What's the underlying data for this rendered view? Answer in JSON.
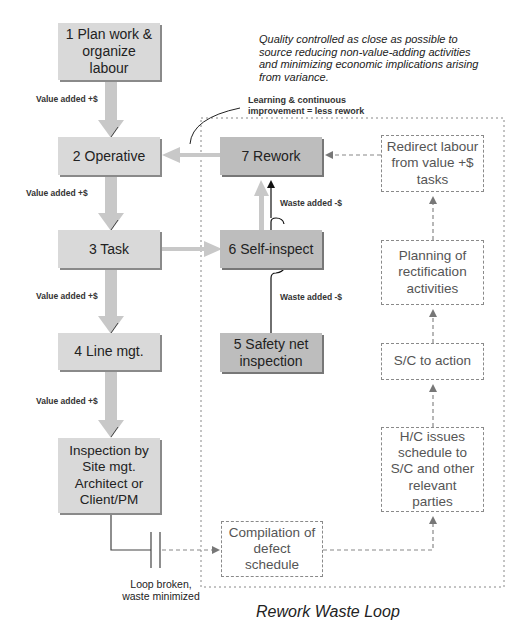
{
  "title": "Rework Waste Loop",
  "note": "Quality controlled as close as possible to source reducing non-value-adding activities and minimizing economic implications arising from variance.",
  "learning_label": "Learning & continuous improvement = less rework",
  "loop_broken_label": "Loop broken, waste minimized",
  "main_flow": [
    {
      "id": "1",
      "label": "1 Plan work & organize labour"
    },
    {
      "id": "2",
      "label": "2 Operative"
    },
    {
      "id": "3",
      "label": "3 Task"
    },
    {
      "id": "4",
      "label": "4 Line mgt."
    },
    {
      "id": "inspection",
      "label": "Inspection by Site mgt. Architect or Client/PM"
    }
  ],
  "value_added_labels": [
    "Value added +$",
    "Value added +$",
    "Value added +$",
    "Value added +$"
  ],
  "rework_nodes": [
    {
      "id": "7",
      "label": "7 Rework"
    },
    {
      "id": "6",
      "label": "6 Self-inspect"
    },
    {
      "id": "5",
      "label": "5 Safety net inspection"
    }
  ],
  "waste_added_labels": [
    "Waste added -$",
    "Waste added -$"
  ],
  "loop_nodes": [
    {
      "id": "redirect",
      "label": "Redirect labour from value +$ tasks"
    },
    {
      "id": "planning",
      "label": "Planning of rectification activities"
    },
    {
      "id": "sc_action",
      "label": "S/C to action"
    },
    {
      "id": "hc_issues",
      "label": "H/C issues schedule to S/C and other relevant parties"
    },
    {
      "id": "compilation",
      "label": "Compilation of defect schedule"
    }
  ],
  "colors": {
    "main_box": "#d9d9d9",
    "rework_box": "#bdbdbd",
    "arrow": "#c8c8c8",
    "dashed": "#8a8a8a",
    "text": "#222222"
  }
}
